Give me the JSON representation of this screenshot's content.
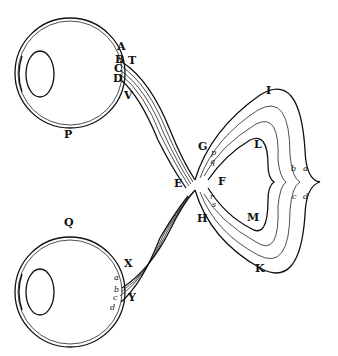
{
  "figure": {
    "labels": {
      "upper_eye": "P",
      "lower_eye": "Q",
      "upper_points": [
        "A",
        "B",
        "C",
        "D"
      ],
      "T": "T",
      "V": "V",
      "G": "G",
      "H": "H",
      "E": "E",
      "F": "F",
      "I": "I",
      "K": "K",
      "L": "L",
      "M": "M",
      "inner_upper": [
        "p",
        "q"
      ],
      "inner_lower": [
        "r",
        "s"
      ],
      "right_tracts": [
        "b",
        "a",
        "c",
        "d"
      ],
      "X": "X",
      "Y": "Y",
      "lower_points": [
        "a",
        "b",
        "c",
        "d"
      ]
    }
  }
}
